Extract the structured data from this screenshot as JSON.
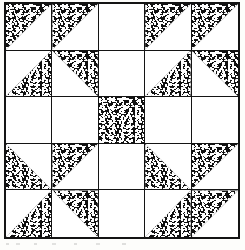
{
  "figure": {
    "kind": "quilt-block-diagram",
    "title": "",
    "caption": "",
    "grid_rows": 5,
    "grid_columns": 5,
    "colors": {
      "background": "#ffffff",
      "fill_dark": "#111111",
      "line": "#141414"
    },
    "legend": {
      "shape_names": {
        "tri-tl": "triangle-top-left",
        "tri-tr": "triangle-top-right",
        "tri-bl": "triangle-bottom-left",
        "tri-br": "triangle-bottom-right",
        "full": "solid-square",
        "none": "blank-square"
      }
    }
  },
  "chart_data": {
    "type": "heatmap",
    "title": "",
    "xlabel": "",
    "ylabel": "",
    "categories": [
      "c1",
      "c2",
      "c3",
      "c4",
      "c5"
    ],
    "rows": [
      "r1",
      "r2",
      "r3",
      "r4",
      "r5"
    ],
    "cells": [
      [
        {
          "shape": "tri-tl",
          "fill": "speckle"
        },
        {
          "shape": "tri-tl",
          "fill": "speckle"
        },
        {
          "shape": "none",
          "fill": "white"
        },
        {
          "shape": "tri-tl",
          "fill": "speckle"
        },
        {
          "shape": "tri-tl",
          "fill": "speckle"
        }
      ],
      [
        {
          "shape": "tri-br",
          "fill": "speckle"
        },
        {
          "shape": "tri-tr",
          "fill": "speckle"
        },
        {
          "shape": "none",
          "fill": "white"
        },
        {
          "shape": "tri-br",
          "fill": "speckle"
        },
        {
          "shape": "tri-tr",
          "fill": "speckle"
        }
      ],
      [
        {
          "shape": "none",
          "fill": "white"
        },
        {
          "shape": "none",
          "fill": "white"
        },
        {
          "shape": "full",
          "fill": "speckle"
        },
        {
          "shape": "none",
          "fill": "white"
        },
        {
          "shape": "none",
          "fill": "white"
        }
      ],
      [
        {
          "shape": "tri-bl",
          "fill": "speckle"
        },
        {
          "shape": "tri-tl",
          "fill": "speckle"
        },
        {
          "shape": "none",
          "fill": "white"
        },
        {
          "shape": "tri-bl",
          "fill": "speckle"
        },
        {
          "shape": "tri-tl",
          "fill": "speckle"
        }
      ],
      [
        {
          "shape": "tri-br",
          "fill": "speckle"
        },
        {
          "shape": "tri-tr",
          "fill": "speckle"
        },
        {
          "shape": "none",
          "fill": "white"
        },
        {
          "shape": "tri-br",
          "fill": "speckle"
        },
        {
          "shape": "tri-tl",
          "fill": "speckle"
        }
      ]
    ]
  }
}
